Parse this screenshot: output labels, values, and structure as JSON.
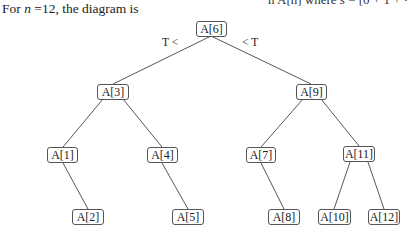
{
  "clipped_header": "n A[n] where s  = [0 + 1 + ·",
  "caption": {
    "prefix": "For ",
    "variable": "n",
    "suffix": " =12, the diagram is"
  },
  "tree": {
    "n": 12,
    "edge_labels": {
      "left": "T <",
      "right": "< T"
    },
    "nodes": {
      "n6": {
        "label": "A[6]",
        "x": 196,
        "y": 21,
        "w": 31
      },
      "n3": {
        "label": "A[3]",
        "x": 97,
        "y": 84,
        "w": 32
      },
      "n9": {
        "label": "A[9]",
        "x": 296,
        "y": 84,
        "w": 31
      },
      "n1": {
        "label": "A[1]",
        "x": 47,
        "y": 147,
        "w": 31
      },
      "n4": {
        "label": "A[4]",
        "x": 147,
        "y": 147,
        "w": 31
      },
      "n7": {
        "label": "A[7]",
        "x": 246,
        "y": 147,
        "w": 30
      },
      "n11": {
        "label": "A[11]",
        "x": 343,
        "y": 146,
        "w": 32
      },
      "n2": {
        "label": "A[2]",
        "x": 72,
        "y": 209,
        "w": 32
      },
      "n5": {
        "label": "A[5]",
        "x": 172,
        "y": 209,
        "w": 32
      },
      "n8": {
        "label": "A[8]",
        "x": 268,
        "y": 209,
        "w": 32
      },
      "n10": {
        "label": "A[10]",
        "x": 318,
        "y": 209,
        "w": 33
      },
      "n12": {
        "label": "A[12]",
        "x": 368,
        "y": 209,
        "w": 32
      }
    },
    "edges": [
      [
        "n6",
        "n3"
      ],
      [
        "n6",
        "n9"
      ],
      [
        "n3",
        "n1"
      ],
      [
        "n3",
        "n4"
      ],
      [
        "n9",
        "n7"
      ],
      [
        "n9",
        "n11"
      ],
      [
        "n1",
        "n2"
      ],
      [
        "n4",
        "n5"
      ],
      [
        "n7",
        "n8"
      ],
      [
        "n11",
        "n10"
      ],
      [
        "n11",
        "n12"
      ]
    ]
  }
}
